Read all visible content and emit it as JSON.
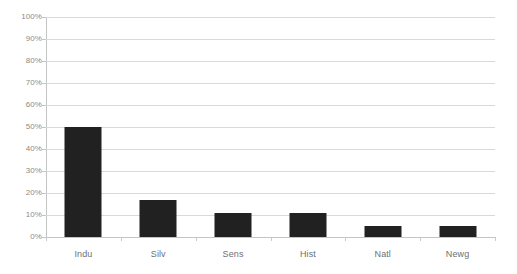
{
  "chart_data": {
    "type": "bar",
    "title": "",
    "subtitle": "",
    "xlabel": "",
    "ylabel": "",
    "categories": [
      "Indu",
      "Silv",
      "Sens",
      "Hist",
      "Natl",
      "Newg"
    ],
    "values": [
      50,
      17,
      11,
      11,
      5,
      5
    ],
    "value_suffix": "%",
    "series": [
      {
        "name": "",
        "values": [
          50,
          17,
          11,
          11,
          5,
          5
        ]
      }
    ],
    "ylim": [
      0,
      100
    ],
    "y_ticks": [
      0,
      10,
      20,
      30,
      40,
      50,
      60,
      70,
      80,
      90,
      100
    ],
    "y_tick_labels": [
      "0%",
      "10%",
      "20%",
      "30%",
      "40%",
      "50%",
      "60%",
      "70%",
      "80%",
      "90%",
      "100%"
    ],
    "grid": true,
    "grid_axis": "y",
    "legend": false,
    "legend_position": "none",
    "bar_color": "#212121",
    "gridline_color": "#d9d9d9",
    "axis_color": "#c4c4c4",
    "tick_label_color": "#8a8a8a",
    "category_label_color": "#6f6f6f",
    "background_color": "#ffffff",
    "annotations": []
  }
}
